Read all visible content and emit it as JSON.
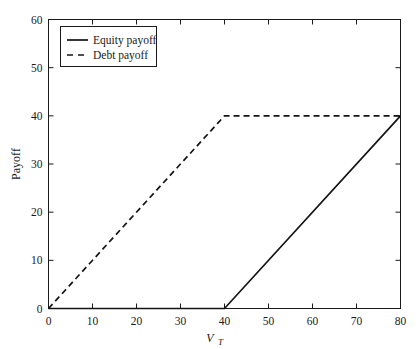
{
  "chart_data": {
    "type": "line",
    "title": "",
    "xlabel": "V_T",
    "xlabel_base": "V",
    "xlabel_sub": "T",
    "ylabel": "Payoff",
    "xlim": [
      0,
      80
    ],
    "ylim": [
      0,
      60
    ],
    "xticks": [
      0,
      10,
      20,
      30,
      40,
      50,
      60,
      70,
      80
    ],
    "yticks": [
      0,
      10,
      20,
      30,
      40,
      50,
      60
    ],
    "xtick_labels": [
      "0",
      "10",
      "20",
      "30",
      "40",
      "50",
      "60",
      "70",
      "80"
    ],
    "ytick_labels": [
      "0",
      "10",
      "20",
      "30",
      "40",
      "50",
      "60"
    ],
    "grid": false,
    "legend_position": "upper left",
    "face_color": "#ffffff",
    "line_color": "#141414",
    "series": [
      {
        "name": "Equity payoff",
        "style": "solid",
        "x": [
          0,
          40,
          80
        ],
        "values": [
          0,
          0,
          40
        ]
      },
      {
        "name": "Debt payoff",
        "style": "dashed",
        "x": [
          0,
          40,
          80
        ],
        "values": [
          0,
          40,
          40
        ]
      }
    ],
    "annotations": []
  },
  "legend": {
    "entries": [
      {
        "label": "Equity payoff",
        "style": "solid"
      },
      {
        "label": "Debt payoff",
        "style": "dashed"
      }
    ]
  }
}
